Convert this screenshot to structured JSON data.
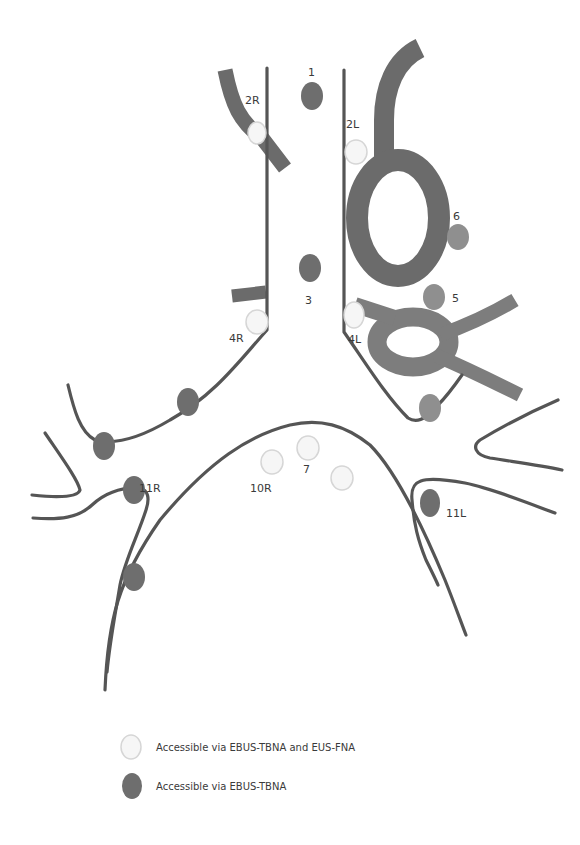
{
  "diagram": {
    "type": "mediastinal lymph node station map",
    "colors": {
      "airway_outline": "#555555",
      "vessel_dark": "#6b6b6b",
      "vessel_mid": "#7d7d7d",
      "node_ebus_only": "#6e6e6e",
      "node_ebus_and_eus": "#f6f6f6",
      "node_other": "#8f8f8f"
    },
    "station_labels": {
      "s1": "1",
      "s2R": "2R",
      "s2L": "2L",
      "s3": "3",
      "s4R": "4R",
      "s4L": "4L",
      "s5": "5",
      "s6": "6",
      "s7": "7",
      "s10R": "10R",
      "s11R": "11R",
      "s11L": "11L"
    },
    "nodes": [
      {
        "station": "1",
        "access": "EBUS-TBNA"
      },
      {
        "station": "2R",
        "access": "EBUS-TBNA and EUS-FNA"
      },
      {
        "station": "2L",
        "access": "EBUS-TBNA and EUS-FNA"
      },
      {
        "station": "3",
        "access": "EBUS-TBNA"
      },
      {
        "station": "4R",
        "access": "EBUS-TBNA and EUS-FNA"
      },
      {
        "station": "4L",
        "access": "EBUS-TBNA and EUS-FNA"
      },
      {
        "station": "5",
        "access": "other"
      },
      {
        "station": "6",
        "access": "other"
      },
      {
        "station": "7",
        "access": "EBUS-TBNA and EUS-FNA"
      },
      {
        "station": "10R",
        "access": "EBUS-TBNA and EUS-FNA"
      },
      {
        "station": "11R",
        "access": "EBUS-TBNA"
      },
      {
        "station": "11L",
        "access": "EBUS-TBNA"
      }
    ]
  },
  "legend": {
    "items": [
      {
        "label": "Accessible via EBUS-TBNA and EUS-FNA",
        "swatch": "light"
      },
      {
        "label": "Accessible via EBUS-TBNA",
        "swatch": "dark"
      }
    ]
  }
}
